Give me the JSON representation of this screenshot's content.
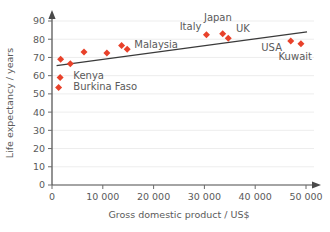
{
  "chart_data": {
    "type": "scatter",
    "title": "",
    "xlabel": "Gross domestic product / US$",
    "ylabel": "Life expectancy / years",
    "xlim": [
      0,
      50000
    ],
    "ylim": [
      0,
      90
    ],
    "xticks": [
      0,
      10000,
      20000,
      30000,
      40000,
      50000
    ],
    "xtick_labels": [
      "0",
      "10 000",
      "20 000",
      "30 000",
      "40 000",
      "50 000"
    ],
    "yticks": [
      0,
      10,
      20,
      30,
      40,
      50,
      60,
      70,
      80,
      90
    ],
    "ytick_labels": [
      "0",
      "10",
      "20",
      "30",
      "40",
      "50",
      "60",
      "70",
      "80",
      "90"
    ],
    "grid": "horizontal",
    "legend": "none",
    "marker_shape": "diamond",
    "marker_color": "#e8412a",
    "points": [
      {
        "x": 1300,
        "y": 53.5,
        "label": "Burkina Faso"
      },
      {
        "x": 1600,
        "y": 59.0,
        "label": "Kenya"
      },
      {
        "x": 1700,
        "y": 69.0,
        "label": ""
      },
      {
        "x": 3600,
        "y": 66.5,
        "label": ""
      },
      {
        "x": 6300,
        "y": 73.0,
        "label": ""
      },
      {
        "x": 10800,
        "y": 72.5,
        "label": ""
      },
      {
        "x": 13700,
        "y": 76.5,
        "label": "Malaysia"
      },
      {
        "x": 14800,
        "y": 74.5,
        "label": ""
      },
      {
        "x": 30400,
        "y": 82.5,
        "label": "Italy"
      },
      {
        "x": 33600,
        "y": 83.0,
        "label": "Japan"
      },
      {
        "x": 34700,
        "y": 80.5,
        "label": "UK"
      },
      {
        "x": 47000,
        "y": 79.0,
        "label": "USA"
      },
      {
        "x": 49000,
        "y": 77.5,
        "label": "Kuwait"
      }
    ],
    "trendline": {
      "type": "line-of-best-fit",
      "color": "#3a3a3a",
      "x_start": 900,
      "y_start": 65.5,
      "x_end": 50200,
      "y_end": 84.0
    },
    "annotations": [
      {
        "text": "Kenya",
        "x": 4200,
        "y": 60.0,
        "anchor": "start"
      },
      {
        "text": "Burkina Faso",
        "x": 4200,
        "y": 54.0,
        "anchor": "start"
      },
      {
        "text": "Malaysia",
        "x": 16200,
        "y": 77.0,
        "anchor": "start"
      },
      {
        "text": "Italy",
        "x": 29400,
        "y": 87.0,
        "anchor": "end"
      },
      {
        "text": "Japan",
        "x": 35400,
        "y": 92.0,
        "anchor": "end"
      },
      {
        "text": "UK",
        "x": 36200,
        "y": 86.0,
        "anchor": "start"
      },
      {
        "text": "USA",
        "x": 41200,
        "y": 75.5,
        "anchor": "start"
      },
      {
        "text": "Kuwait",
        "x": 44600,
        "y": 70.5,
        "anchor": "start"
      }
    ]
  }
}
